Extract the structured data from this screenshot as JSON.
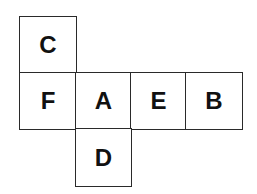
{
  "diagram": {
    "type": "cube-net",
    "cell_size": 56,
    "faces": [
      {
        "label": "C",
        "row": 0,
        "col": 0
      },
      {
        "label": "F",
        "row": 1,
        "col": 0
      },
      {
        "label": "A",
        "row": 1,
        "col": 1
      },
      {
        "label": "E",
        "row": 1,
        "col": 2
      },
      {
        "label": "B",
        "row": 1,
        "col": 3
      },
      {
        "label": "D",
        "row": 2,
        "col": 1
      }
    ],
    "colors": {
      "line": "#2a2a2a",
      "text": "#111111",
      "background": "#ffffff"
    }
  }
}
